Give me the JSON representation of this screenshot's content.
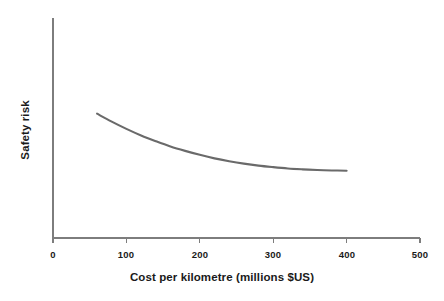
{
  "chart_data": {
    "type": "line",
    "title": "",
    "subtitle": "",
    "xlabel": "Cost per kilometre (millions $US)",
    "ylabel": "Safety risk",
    "xlim": [
      0,
      500
    ],
    "ylim": [
      0,
      1
    ],
    "xticks": [
      0,
      100,
      200,
      300,
      400,
      500
    ],
    "xtick_labels": [
      "0",
      "100",
      "200",
      "300",
      "400",
      "500"
    ],
    "yticks": [],
    "ytick_labels": [],
    "grid": false,
    "legend": null,
    "annotations": [],
    "line_color": "#6a6a6a",
    "axis_color": "#7d7d7d",
    "series": [
      {
        "name": "Safety risk vs cost",
        "x": [
          60,
          80,
          100,
          120,
          140,
          160,
          180,
          200,
          220,
          240,
          260,
          280,
          300,
          320,
          340,
          360,
          380,
          400
        ],
        "y": [
          0.565,
          0.529,
          0.496,
          0.466,
          0.44,
          0.416,
          0.396,
          0.378,
          0.362,
          0.349,
          0.338,
          0.329,
          0.322,
          0.316,
          0.312,
          0.309,
          0.307,
          0.306
        ]
      }
    ]
  },
  "tick_labels": {
    "x0": "0",
    "x100": "100",
    "x200": "200",
    "x300": "300",
    "x400": "400",
    "x500": "500"
  },
  "labels": {
    "x_axis_title": "Cost per kilometre (millions $US)",
    "y_axis_title": "Safety risk"
  }
}
